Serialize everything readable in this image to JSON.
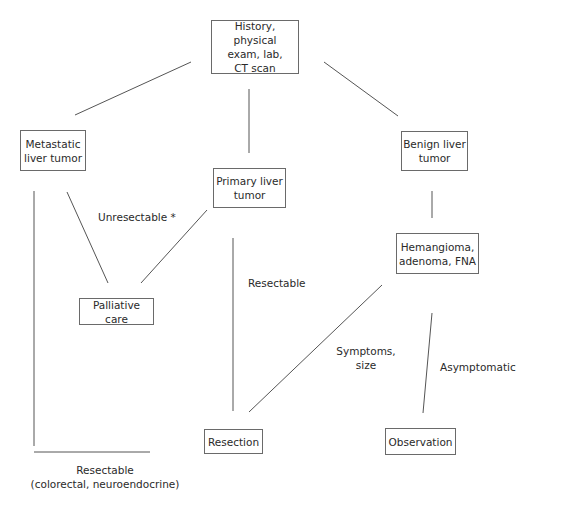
{
  "nodes": {
    "workup": "History, physical\nexam, lab,\nCT scan",
    "metastatic": "Metastatic\nliver tumor",
    "primary": "Primary liver\ntumor",
    "benign": "Benign liver\ntumor",
    "hemangioma": "Hemangioma,\nadenoma, FNA",
    "palliative": "Palliative care",
    "resection": "Resection",
    "observation": "Observation"
  },
  "edge_labels": {
    "unresectable": "Unresectable *",
    "resectable": "Resectable",
    "symptoms": "Symptoms,\nsize",
    "asymptomatic": "Asymptomatic",
    "resectable_metastatic": "Resectable\n(colorectal, neuroendocrine)"
  },
  "colors": {
    "stroke": "#555555",
    "box_border": "#6a6a6a",
    "text": "#2a2a2a"
  }
}
